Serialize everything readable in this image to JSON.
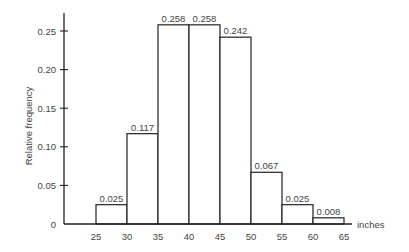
{
  "chart_data": {
    "type": "bar",
    "subtype": "histogram",
    "title": "",
    "xlabel": "inches",
    "ylabel": "Relative frequency",
    "bin_edges": [
      25,
      30,
      35,
      40,
      45,
      50,
      55,
      60,
      65
    ],
    "categories": [
      "25-30",
      "30-35",
      "35-40",
      "40-45",
      "45-50",
      "50-55",
      "55-60",
      "60-65"
    ],
    "values": [
      0.025,
      0.117,
      0.258,
      0.258,
      0.242,
      0.067,
      0.025,
      0.008
    ],
    "value_labels": [
      "0.025",
      "0.117",
      "0.258",
      "0.258",
      "0.242",
      "0.067",
      "0.025",
      "0.008"
    ],
    "x_ticks": [
      "25",
      "30",
      "35",
      "40",
      "45",
      "50",
      "55",
      "60",
      "65"
    ],
    "y_ticks": [
      "0",
      "0.05",
      "0.10",
      "0.15",
      "0.20",
      "0.25"
    ],
    "y_tick_values": [
      0,
      0.05,
      0.1,
      0.15,
      0.2,
      0.25
    ],
    "ylim": [
      0,
      0.27
    ],
    "xlim": [
      20,
      65
    ],
    "grid": false,
    "legend": null
  },
  "colors": {
    "line": "#222222",
    "fill": "#ffffff",
    "text": "#444444"
  }
}
